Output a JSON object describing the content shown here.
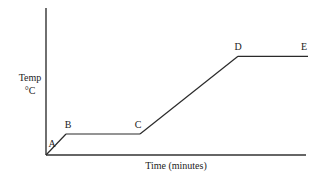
{
  "chart_data": {
    "type": "line",
    "title": "",
    "xlabel": "Time (minutes)",
    "ylabel": [
      "Temp",
      "°C"
    ],
    "xlim": [
      0,
      13
    ],
    "ylim": [
      0,
      7
    ],
    "grid": false,
    "legend": null,
    "series": [
      {
        "name": "heating curve",
        "points": [
          {
            "label": "A",
            "x": 0,
            "y": 0
          },
          {
            "label": "B",
            "x": 1.0,
            "y": 1.0
          },
          {
            "label": "C",
            "x": 4.7,
            "y": 1.0
          },
          {
            "label": "D",
            "x": 9.6,
            "y": 4.7
          },
          {
            "label": "E",
            "x": 13.1,
            "y": 4.7
          }
        ]
      }
    ]
  }
}
